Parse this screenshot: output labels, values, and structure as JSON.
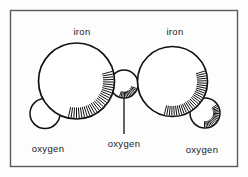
{
  "figure": {
    "caption_absent": true,
    "background_color": "#fdfdfd",
    "frame": {
      "name": "diagram-border",
      "stroke_color": "#5a5a5a",
      "x": 10,
      "y": 10,
      "width": 228,
      "height": 157
    },
    "ink_color": "#111111",
    "fill_color": "#ffffff"
  },
  "labels": {
    "iron_left": "iron",
    "iron_right": "iron",
    "oxygen_left": "oxygen",
    "oxygen_center": "oxygen",
    "oxygen_right": "oxygen"
  },
  "atoms": [
    {
      "id": "iron-left",
      "element": "iron",
      "kind": "large",
      "cx": 76.5,
      "cy": 81,
      "r": 38,
      "shaded": true,
      "shade_start_deg": -15,
      "shade_end_deg": 105
    },
    {
      "id": "iron-right",
      "element": "iron",
      "kind": "large",
      "cx": 172.5,
      "cy": 81.5,
      "r": 35,
      "shaded": true,
      "shade_start_deg": -18,
      "shade_end_deg": 108
    },
    {
      "id": "oxygen-left",
      "element": "oxygen",
      "kind": "small",
      "cx": 45,
      "cy": 113.5,
      "r": 15,
      "shaded": false,
      "shade_start_deg": 0,
      "shade_end_deg": 0
    },
    {
      "id": "oxygen-center",
      "element": "oxygen",
      "kind": "small",
      "cx": 124,
      "cy": 84,
      "r": 14,
      "shaded": true,
      "shade_start_deg": 20,
      "shade_end_deg": 115
    },
    {
      "id": "oxygen-right",
      "element": "oxygen",
      "kind": "small",
      "cx": 205,
      "cy": 113,
      "r": 15,
      "shaded": true,
      "shade_start_deg": -35,
      "shade_end_deg": 95
    }
  ],
  "leader_line": {
    "name": "oxygen-center-leader",
    "x1": 124,
    "y1": 98,
    "x2": 124,
    "y2": 134
  },
  "label_positions": {
    "iron_left": {
      "x": 82,
      "y": 35,
      "anchor": "middle"
    },
    "iron_right": {
      "x": 175,
      "y": 35,
      "anchor": "middle"
    },
    "oxygen_left": {
      "x": 48,
      "y": 152,
      "anchor": "middle"
    },
    "oxygen_center": {
      "x": 124,
      "y": 147,
      "anchor": "middle"
    },
    "oxygen_right": {
      "x": 202,
      "y": 153,
      "anchor": "middle"
    }
  }
}
